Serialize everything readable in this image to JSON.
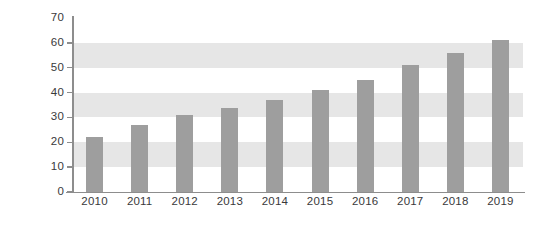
{
  "chart_data": {
    "type": "bar",
    "title": "",
    "subtitle": "",
    "xlabel": "",
    "ylabel": "",
    "categories": [
      "2010",
      "2011",
      "2012",
      "2013",
      "2014",
      "2015",
      "2016",
      "2017",
      "2018",
      "2019"
    ],
    "values": [
      22,
      27,
      31,
      34,
      37,
      41,
      45,
      51,
      56,
      61
    ],
    "series": [
      {
        "name": "",
        "values": [
          22,
          27,
          31,
          34,
          37,
          41,
          45,
          51,
          56,
          61
        ]
      }
    ],
    "ylim": [
      0,
      70
    ],
    "y_ticks": [
      0,
      10,
      20,
      30,
      40,
      50,
      60,
      70
    ],
    "y_tick_labels": [
      "0",
      "10",
      "20",
      "30",
      "40",
      "50",
      "60",
      "70"
    ],
    "grid": "alternating-horizontal-bands",
    "grid_bands": [
      {
        "from": 10,
        "to": 20
      },
      {
        "from": 30,
        "to": 40
      },
      {
        "from": 50,
        "to": 60
      }
    ],
    "legend": null,
    "legend_position": "none",
    "annotations": [],
    "colors": {
      "bar": "#9e9e9e",
      "band": "#e6e6e6",
      "axis": "#8d8d8d",
      "text": "#39393b",
      "background": "#ffffff"
    }
  }
}
